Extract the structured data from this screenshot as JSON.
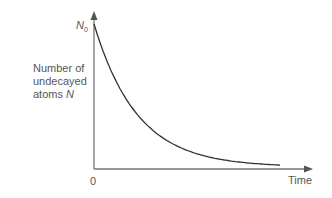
{
  "chart_data": {
    "type": "line",
    "title": "",
    "xlabel": "Time",
    "ylabel": "Number of undecayed atoms N",
    "x_tick_labels": [
      "0"
    ],
    "y_tick_labels": [
      "N0"
    ],
    "series": [
      {
        "name": "Radioactive decay",
        "function": "N = N0 * exp(-lambda t)",
        "x": [
          0,
          1,
          2,
          3,
          4,
          5,
          6
        ],
        "values": [
          1.0,
          0.5,
          0.25,
          0.125,
          0.0625,
          0.03125,
          0.016
        ]
      }
    ],
    "grid": false,
    "legend": null,
    "ylim": [
      0,
      1.1
    ],
    "colors": {
      "curve": "#333333",
      "axes": "#777777"
    }
  },
  "labels": {
    "ylabel_line1": "Number of",
    "ylabel_line2": "undecayed",
    "ylabel_line3_prefix": "atoms ",
    "ylabel_line3_var": "N",
    "n0_var": "N",
    "n0_sub": "0",
    "x_origin": "0",
    "xlabel": "Time"
  }
}
